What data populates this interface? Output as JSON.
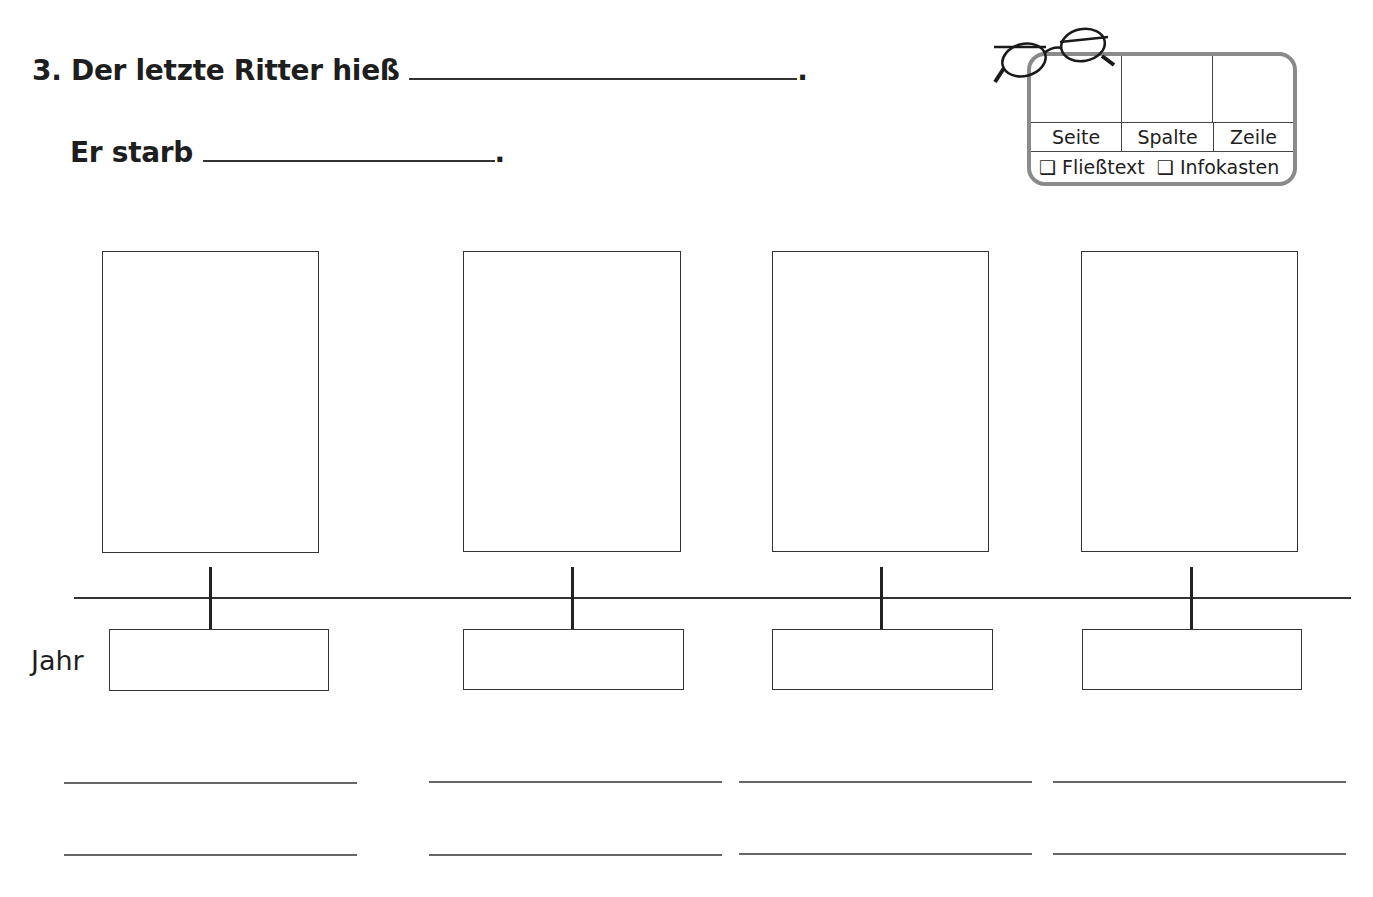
{
  "question": {
    "number": "3.",
    "line1_text": "Der letzte Ritter hieß",
    "line1_end": ".",
    "line2_text": "Er starb",
    "line2_end": "."
  },
  "reference_box": {
    "columns": [
      "Seite",
      "Spalte",
      "Zeile"
    ],
    "options": [
      {
        "checkbox": "❑",
        "label": "Fließtext"
      },
      {
        "checkbox": "❑",
        "label": "Infokasten"
      }
    ],
    "icon": "glasses-icon"
  },
  "timeline": {
    "year_label": "Jahr",
    "entries": [
      {
        "picture_box": "",
        "year": "",
        "line1": "",
        "line2": ""
      },
      {
        "picture_box": "",
        "year": "",
        "line1": "",
        "line2": ""
      },
      {
        "picture_box": "",
        "year": "",
        "line1": "",
        "line2": ""
      },
      {
        "picture_box": "",
        "year": "",
        "line1": "",
        "line2": ""
      }
    ]
  }
}
